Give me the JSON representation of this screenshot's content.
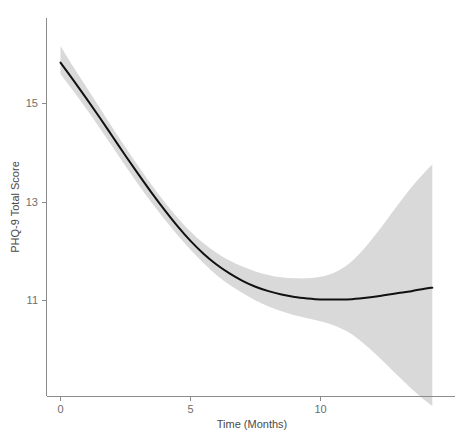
{
  "chart_data": {
    "type": "line",
    "title": "",
    "subtitle": "",
    "xlabel": "Time (Months)",
    "ylabel": "PHQ-9 Total Score",
    "xlim": [
      -0.7,
      15.0
    ],
    "ylim": [
      9.4,
      16.3
    ],
    "xticks": [
      0,
      5,
      10
    ],
    "xtick_labels": [
      "0",
      "5",
      "10"
    ],
    "yticks": [
      11,
      13,
      15
    ],
    "ytick_labels": [
      "11",
      "13",
      "15"
    ],
    "grid": false,
    "legend": null,
    "annotations": [],
    "series": [
      {
        "name": "Predicted PHQ-9 Total Score",
        "style": "solid-black-line",
        "color": "#111111",
        "x": [
          0,
          0.5,
          1,
          1.5,
          2,
          2.5,
          3,
          3.5,
          4,
          4.5,
          5,
          5.5,
          6,
          6.5,
          7,
          7.5,
          8,
          8.5,
          9,
          9.5,
          10,
          10.5,
          11,
          11.5,
          12,
          12.5,
          13,
          13.5,
          14,
          14.3
        ],
        "values": [
          15.83,
          15.47,
          15.1,
          14.72,
          14.33,
          13.94,
          13.56,
          13.19,
          12.84,
          12.51,
          12.21,
          11.95,
          11.73,
          11.55,
          11.4,
          11.28,
          11.19,
          11.12,
          11.07,
          11.04,
          11.02,
          11.02,
          11.02,
          11.04,
          11.07,
          11.11,
          11.15,
          11.19,
          11.24,
          11.26
        ]
      }
    ],
    "confidence_band": {
      "name": "95% Confidence Interval",
      "color": "#d9d9d9",
      "x": [
        0,
        0.5,
        1,
        1.5,
        2,
        2.5,
        3,
        3.5,
        4,
        4.5,
        5,
        5.5,
        6,
        6.5,
        7,
        7.5,
        8,
        8.5,
        9,
        9.5,
        10,
        10.5,
        11,
        11.5,
        12,
        12.5,
        13,
        13.5,
        14,
        14.3
      ],
      "upper": [
        16.17,
        15.74,
        15.33,
        14.92,
        14.51,
        14.11,
        13.72,
        13.35,
        13.0,
        12.68,
        12.4,
        12.16,
        11.97,
        11.81,
        11.69,
        11.59,
        11.52,
        11.47,
        11.45,
        11.45,
        11.48,
        11.56,
        11.71,
        11.95,
        12.26,
        12.6,
        12.96,
        13.3,
        13.6,
        13.76
      ],
      "lower": [
        15.6,
        15.25,
        14.89,
        14.51,
        14.12,
        13.73,
        13.35,
        12.99,
        12.65,
        12.33,
        12.03,
        11.76,
        11.52,
        11.32,
        11.15,
        11.0,
        10.88,
        10.78,
        10.7,
        10.64,
        10.58,
        10.5,
        10.38,
        10.2,
        9.97,
        9.72,
        9.46,
        9.21,
        8.98,
        8.86
      ]
    }
  },
  "axes": {
    "x_axis_label": "Time (Months)",
    "y_axis_label": "PHQ-9 Total Score",
    "x_tick_labels": [
      "0",
      "5",
      "10"
    ],
    "y_tick_labels": [
      "15",
      "13",
      "11"
    ]
  },
  "colors": {
    "line": "#111111",
    "band": "#d9d9d9",
    "axis": "#8c8c8c",
    "text": "#4a4a4a",
    "background": "#ffffff"
  }
}
